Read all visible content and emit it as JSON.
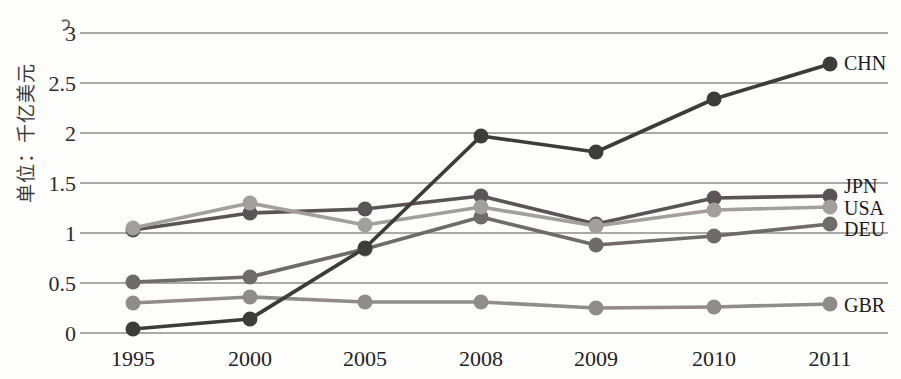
{
  "chart_data": {
    "type": "line",
    "title": "",
    "unit_label": "单位：千亿美元",
    "categories": [
      "1995",
      "2000",
      "2005",
      "2008",
      "2009",
      "2010",
      "2011"
    ],
    "y_ticks": [
      0,
      0.5,
      1,
      1.5,
      2,
      2.5,
      3
    ],
    "y_tick_labels": [
      "0",
      "0.5",
      "1",
      "1.5",
      "2",
      "2.5",
      "3"
    ],
    "ylim": [
      0,
      3
    ],
    "grid": true,
    "legend_position": "right-end-labels",
    "colors": {
      "grid": "#565656",
      "text": "#222222"
    },
    "series": [
      {
        "name": "CHN",
        "color": "#3e3c3b",
        "values": [
          0.04,
          0.14,
          0.85,
          1.97,
          1.81,
          2.34,
          2.69
        ]
      },
      {
        "name": "JPN",
        "color": "#5a5456",
        "values": [
          1.03,
          1.2,
          1.24,
          1.37,
          1.09,
          1.35,
          1.37
        ]
      },
      {
        "name": "USA",
        "color": "#a29f9c",
        "values": [
          1.05,
          1.3,
          1.08,
          1.26,
          1.07,
          1.23,
          1.26
        ]
      },
      {
        "name": "DEU",
        "color": "#6f6b68",
        "values": [
          0.51,
          0.56,
          0.84,
          1.16,
          0.88,
          0.97,
          1.09
        ]
      },
      {
        "name": "GBR",
        "color": "#8f8c89",
        "values": [
          0.3,
          0.36,
          0.31,
          0.31,
          0.25,
          0.26,
          0.29
        ]
      }
    ]
  }
}
